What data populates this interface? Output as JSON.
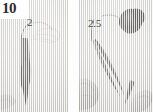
{
  "figure": {
    "number": "10",
    "background_color": "#efeeec",
    "ink_color": "#3a3a38",
    "label_color": "#4a4a48"
  },
  "panels": [
    {
      "id": "left",
      "name": "panel-left",
      "callout": {
        "text": "2",
        "name": "callout-label-2",
        "description": "leader line pointing to specimen tip"
      },
      "subject": "forceps holding elongated dark specimen"
    },
    {
      "id": "right",
      "name": "panel-right",
      "callout": {
        "text": "2.5",
        "name": "callout-label-2-5",
        "description": "leader line pointing to forceps tip"
      },
      "subject": "hands holding forceps with dark lobed specimen"
    }
  ],
  "icons": {
    "forceps": "forceps-icon",
    "specimen": "specimen-icon",
    "hand": "hand-icon"
  }
}
